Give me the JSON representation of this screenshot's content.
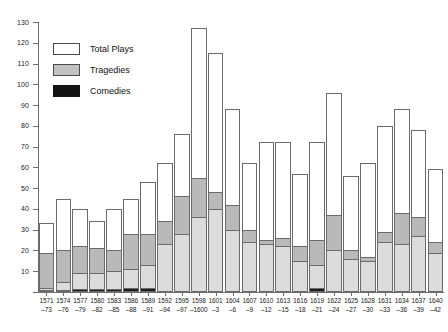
{
  "chart_data": {
    "type": "bar",
    "title": "",
    "subtitle": "",
    "xlabel": "",
    "ylabel": "",
    "stacked": true,
    "grid": false,
    "legend_position": "top-left",
    "ylim": [
      0,
      130
    ],
    "yticks": [
      0,
      10,
      20,
      30,
      40,
      50,
      60,
      70,
      80,
      90,
      100,
      110,
      120,
      130
    ],
    "ytick_labels": [
      "",
      "10",
      "20",
      "30",
      "40",
      "50",
      "60",
      "70",
      "80",
      "90",
      "100",
      "110",
      "120",
      "130"
    ],
    "categories": [
      "1571–73",
      "1574–76",
      "1577–79",
      "1580–82",
      "1583–85",
      "1586–88",
      "1589–91",
      "1592–94",
      "1595–97",
      "1598–1600",
      "1601–3",
      "1604–6",
      "1607–9",
      "1610–12",
      "1613–15",
      "1616–18",
      "1619–21",
      "1622–24",
      "1625–27",
      "1628–30",
      "1631–33",
      "1634–36",
      "1637–39",
      "1640–42"
    ],
    "category_lines": [
      [
        "1571",
        "–73"
      ],
      [
        "1574",
        "–76"
      ],
      [
        "1577",
        "–79"
      ],
      [
        "1580",
        "–82"
      ],
      [
        "1583",
        "–85"
      ],
      [
        "1586",
        "–88"
      ],
      [
        "1589",
        "–91"
      ],
      [
        "1592",
        "–94"
      ],
      [
        "1595",
        "–97"
      ],
      [
        "1598",
        "–1600"
      ],
      [
        "1601",
        "–3"
      ],
      [
        "1604",
        "–6"
      ],
      [
        "1607",
        "–9"
      ],
      [
        "1610",
        "–12"
      ],
      [
        "1613",
        "–15"
      ],
      [
        "1616",
        "–18"
      ],
      [
        "1619",
        "–21"
      ],
      [
        "1622",
        "–24"
      ],
      [
        "1625",
        "–27"
      ],
      [
        "1628",
        "–30"
      ],
      [
        "1631",
        "–33"
      ],
      [
        "1634",
        "–36"
      ],
      [
        "1637",
        "–39"
      ],
      [
        "1640",
        "–42"
      ]
    ],
    "series": [
      {
        "name": "Total Plays",
        "color": "#ffffff",
        "values": [
          33,
          45,
          40,
          34,
          40,
          45,
          53,
          62,
          76,
          127,
          115,
          88,
          62,
          72,
          72,
          57,
          72,
          96,
          56,
          62,
          80,
          88,
          78,
          59
        ]
      },
      {
        "name": "Tragedies",
        "color": "#b9b9b9",
        "values": [
          19,
          20,
          22,
          21,
          20,
          28,
          28,
          34,
          46,
          55,
          48,
          42,
          30,
          25,
          26,
          22,
          25,
          37,
          20,
          17,
          29,
          38,
          36,
          24
        ]
      },
      {
        "name": "Comedies",
        "color": "#1d1d1d",
        "values": [
          2,
          5,
          9,
          9,
          10,
          11,
          13,
          23,
          28,
          36,
          40,
          30,
          24,
          23,
          22,
          15,
          13,
          20,
          16,
          15,
          24,
          23,
          27,
          19
        ]
      }
    ]
  },
  "legend": {
    "items": [
      {
        "label": "Total Plays",
        "swatch": "white-swatch"
      },
      {
        "label": "Tragedies",
        "swatch": "grey-swatch"
      },
      {
        "label": "Comedies",
        "swatch": "black-swatch"
      }
    ]
  }
}
